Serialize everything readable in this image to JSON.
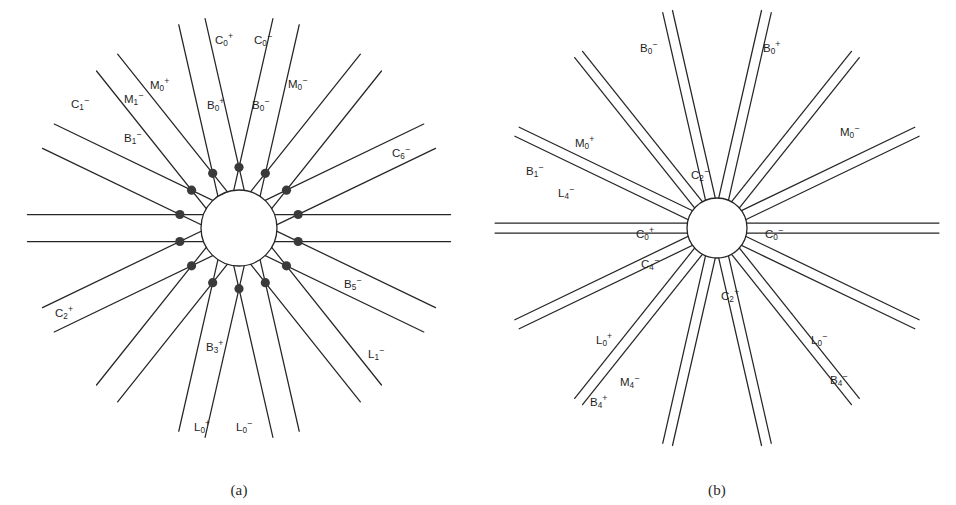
{
  "figure": {
    "background": "#ffffff",
    "line_color": "#262626",
    "node_color": "#3a3a3a",
    "label_color": "#1f1f1f",
    "width": 956,
    "height": 505
  },
  "panels": [
    {
      "id": "a",
      "caption": "(a)",
      "geometry": {
        "cx": 239,
        "cy": 228,
        "symmetry": 7,
        "line_count": 14,
        "inner_radius": 38,
        "outer_radius": 212,
        "node_radius": 4.6,
        "pair_offset": 13.5,
        "rotation_deg": 0,
        "type": "line-arrangement-rosette"
      },
      "labels": [
        {
          "base": "C",
          "sub": "0",
          "sup": "+",
          "x": 215,
          "y": 41,
          "anchor": "start"
        },
        {
          "base": "C",
          "sub": "0",
          "sup": "−",
          "x": 254,
          "y": 41,
          "anchor": "start"
        },
        {
          "base": "M",
          "sub": "0",
          "sup": "+",
          "x": 150,
          "y": 86,
          "anchor": "start"
        },
        {
          "base": "M",
          "sub": "1",
          "sup": "−",
          "x": 124,
          "y": 100,
          "anchor": "start"
        },
        {
          "base": "M",
          "sub": "0",
          "sup": "−",
          "x": 288,
          "y": 85,
          "anchor": "start"
        },
        {
          "base": "C",
          "sub": "1",
          "sup": "−",
          "x": 71,
          "y": 105,
          "anchor": "start"
        },
        {
          "base": "B",
          "sub": "0",
          "sup": "+",
          "x": 207,
          "y": 106,
          "anchor": "start"
        },
        {
          "base": "B",
          "sub": "0",
          "sup": "−",
          "x": 252,
          "y": 106,
          "anchor": "start"
        },
        {
          "base": "B",
          "sub": "1",
          "sup": "−",
          "x": 124,
          "y": 139,
          "anchor": "start"
        },
        {
          "base": "C",
          "sub": "6",
          "sup": "−",
          "x": 392,
          "y": 154,
          "anchor": "start"
        },
        {
          "base": "B",
          "sub": "5",
          "sup": "−",
          "x": 344,
          "y": 285,
          "anchor": "start"
        },
        {
          "base": "C",
          "sub": "2",
          "sup": "+",
          "x": 55,
          "y": 314,
          "anchor": "start"
        },
        {
          "base": "B",
          "sub": "3",
          "sup": "+",
          "x": 206,
          "y": 348,
          "anchor": "start"
        },
        {
          "base": "L",
          "sub": "1",
          "sup": "−",
          "x": 368,
          "y": 355,
          "anchor": "start"
        },
        {
          "base": "L",
          "sub": "0",
          "sup": "+",
          "x": 194,
          "y": 428,
          "anchor": "start"
        },
        {
          "base": "L",
          "sub": "0",
          "sup": "−",
          "x": 236,
          "y": 428,
          "anchor": "start"
        }
      ]
    },
    {
      "id": "b",
      "caption": "(b)",
      "geometry": {
        "cx": 239,
        "cy": 228,
        "symmetry": 7,
        "line_count": 14,
        "inner_radius": 30,
        "outer_radius": 222,
        "node_radius": 4.8,
        "pair_offset": 5.0,
        "rotation_deg": 0,
        "type": "line-arrangement-star"
      },
      "labels": [
        {
          "base": "B",
          "sub": "0",
          "sup": "−",
          "x": 162,
          "y": 49,
          "anchor": "start"
        },
        {
          "base": "B",
          "sub": "0",
          "sup": "+",
          "x": 285,
          "y": 49,
          "anchor": "start"
        },
        {
          "base": "M",
          "sub": "0",
          "sup": "−",
          "x": 362,
          "y": 133,
          "anchor": "start"
        },
        {
          "base": "M",
          "sub": "0",
          "sup": "+",
          "x": 97,
          "y": 144,
          "anchor": "start"
        },
        {
          "base": "B",
          "sub": "1",
          "sup": "−",
          "x": 48,
          "y": 172,
          "anchor": "start"
        },
        {
          "base": "C",
          "sub": "2",
          "sup": "−",
          "x": 213,
          "y": 176,
          "anchor": "start"
        },
        {
          "base": "L",
          "sub": "4",
          "sup": "−",
          "x": 80,
          "y": 194,
          "anchor": "start"
        },
        {
          "base": "C",
          "sub": "0",
          "sup": "+",
          "x": 158,
          "y": 235,
          "anchor": "start"
        },
        {
          "base": "C",
          "sub": "0",
          "sup": "−",
          "x": 287,
          "y": 235,
          "anchor": "start"
        },
        {
          "base": "C",
          "sub": "4",
          "sup": "−",
          "x": 163,
          "y": 265,
          "anchor": "start"
        },
        {
          "base": "C",
          "sub": "2",
          "sup": "+",
          "x": 243,
          "y": 297,
          "anchor": "start"
        },
        {
          "base": "L",
          "sub": "0",
          "sup": "+",
          "x": 118,
          "y": 341,
          "anchor": "start"
        },
        {
          "base": "L",
          "sub": "0",
          "sup": "−",
          "x": 333,
          "y": 341,
          "anchor": "start"
        },
        {
          "base": "M",
          "sub": "4",
          "sup": "−",
          "x": 142,
          "y": 383,
          "anchor": "start"
        },
        {
          "base": "B",
          "sub": "4",
          "sup": "−",
          "x": 352,
          "y": 381,
          "anchor": "start"
        },
        {
          "base": "B",
          "sub": "4",
          "sup": "+",
          "x": 112,
          "y": 403,
          "anchor": "start"
        }
      ]
    }
  ]
}
